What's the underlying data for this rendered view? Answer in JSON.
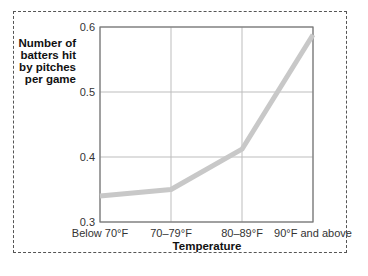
{
  "chart_data": {
    "type": "line",
    "title": "",
    "xlabel": "Temperature",
    "ylabel": "Number of batters hit by pitches per game",
    "categories": [
      "Below 70°F",
      "70–79°F",
      "80–89°F",
      "90°F and above"
    ],
    "values": [
      0.34,
      0.35,
      0.412,
      0.588
    ],
    "yticks": [
      "0.3",
      "0.4",
      "0.5",
      "0.6"
    ],
    "ylim": [
      0.3,
      0.6
    ],
    "grid": true,
    "legend": "none",
    "line_color": "#c8c8c8"
  },
  "labels": {
    "ylabel_lines": [
      "Number of",
      "batters hit",
      "by pitches",
      "per game"
    ],
    "xlabel": "Temperature"
  }
}
